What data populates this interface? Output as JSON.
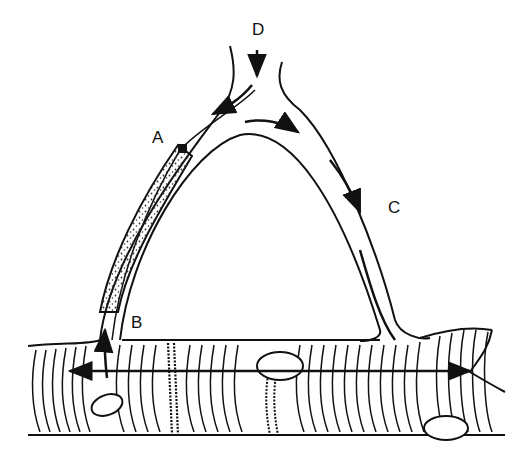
{
  "diagram": {
    "type": "anatomical-line-drawing",
    "labels": {
      "A": "A",
      "B": "B",
      "C": "C",
      "D": "D"
    },
    "colors": {
      "ink": "#111111",
      "background": "#ffffff",
      "stipple": "#333333"
    }
  }
}
